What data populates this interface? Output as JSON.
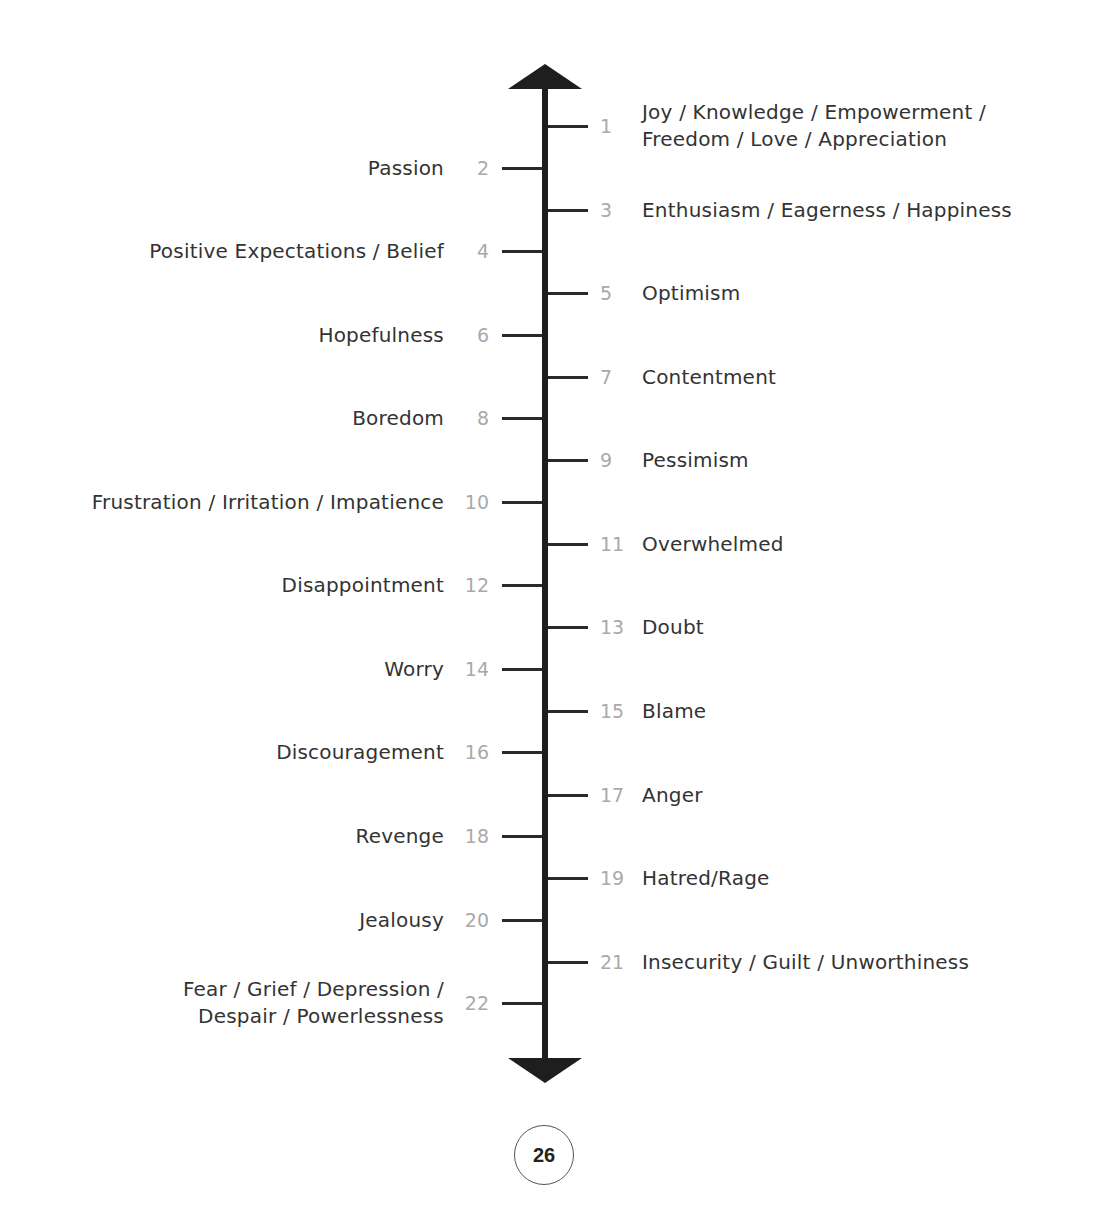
{
  "scale": {
    "direction_top": "higher",
    "direction_bottom": "lower",
    "items": [
      {
        "number": "1",
        "side": "right",
        "lines": [
          "Joy / Knowledge / Empowerment /",
          "Freedom / Love / Appreciation"
        ],
        "y": 126
      },
      {
        "number": "2",
        "side": "left",
        "lines": [
          "Passion"
        ],
        "y": 168
      },
      {
        "number": "3",
        "side": "right",
        "lines": [
          "Enthusiasm / Eagerness / Happiness"
        ],
        "y": 210
      },
      {
        "number": "4",
        "side": "left",
        "lines": [
          "Positive Expectations / Belief"
        ],
        "y": 251
      },
      {
        "number": "5",
        "side": "right",
        "lines": [
          "Optimism"
        ],
        "y": 293
      },
      {
        "number": "6",
        "side": "left",
        "lines": [
          "Hopefulness"
        ],
        "y": 335
      },
      {
        "number": "7",
        "side": "right",
        "lines": [
          "Contentment"
        ],
        "y": 377
      },
      {
        "number": "8",
        "side": "left",
        "lines": [
          "Boredom"
        ],
        "y": 418
      },
      {
        "number": "9",
        "side": "right",
        "lines": [
          "Pessimism"
        ],
        "y": 460
      },
      {
        "number": "10",
        "side": "left",
        "lines": [
          "Frustration / Irritation / Impatience"
        ],
        "y": 502
      },
      {
        "number": "11",
        "side": "right",
        "lines": [
          "Overwhelmed"
        ],
        "y": 544
      },
      {
        "number": "12",
        "side": "left",
        "lines": [
          "Disappointment"
        ],
        "y": 585
      },
      {
        "number": "13",
        "side": "right",
        "lines": [
          "Doubt"
        ],
        "y": 627
      },
      {
        "number": "14",
        "side": "left",
        "lines": [
          "Worry"
        ],
        "y": 669
      },
      {
        "number": "15",
        "side": "right",
        "lines": [
          "Blame"
        ],
        "y": 711
      },
      {
        "number": "16",
        "side": "left",
        "lines": [
          "Discouragement"
        ],
        "y": 752
      },
      {
        "number": "17",
        "side": "right",
        "lines": [
          "Anger"
        ],
        "y": 795
      },
      {
        "number": "18",
        "side": "left",
        "lines": [
          "Revenge"
        ],
        "y": 836
      },
      {
        "number": "19",
        "side": "right",
        "lines": [
          "Hatred/Rage"
        ],
        "y": 878
      },
      {
        "number": "20",
        "side": "left",
        "lines": [
          "Jealousy"
        ],
        "y": 920
      },
      {
        "number": "21",
        "side": "right",
        "lines": [
          "Insecurity / Guilt / Unworthiness"
        ],
        "y": 962
      },
      {
        "number": "22",
        "side": "left",
        "lines": [
          "Fear / Grief / Depression /",
          "Despair / Powerlessness"
        ],
        "y": 1003
      }
    ]
  },
  "colors": {
    "axis": "#1e1e1e",
    "number": "#a9a9a9",
    "label": "#333333"
  },
  "footer": {
    "page_number": "26"
  }
}
